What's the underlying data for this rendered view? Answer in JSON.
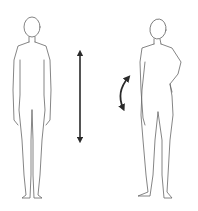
{
  "diagram": {
    "panels": [
      {
        "id": "upright",
        "label": "Upright standing posture",
        "indicator": {
          "type": "vertical-double-arrow",
          "icon": "double-arrow-vertical-icon"
        }
      },
      {
        "id": "shifted",
        "label": "Weight-shifted posture (hand on hip)",
        "indicator": {
          "type": "curved-double-arrow",
          "icon": "double-arrow-curved-icon"
        }
      }
    ],
    "colors": {
      "line": "#555555",
      "arrow": "#2a2a2a",
      "background": "#ffffff"
    }
  }
}
